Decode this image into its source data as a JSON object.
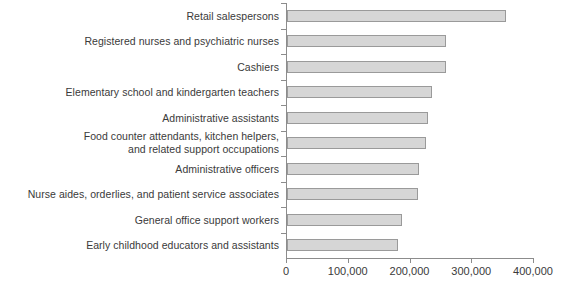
{
  "chart_data": {
    "type": "bar",
    "orientation": "horizontal",
    "title": "",
    "subtitle": "",
    "xlabel": "",
    "ylabel": "",
    "xlim": [
      0,
      400000
    ],
    "grid": false,
    "legend": null,
    "legend_position": "none",
    "xticks": [
      0,
      100000,
      200000,
      300000,
      400000
    ],
    "xtick_labels": [
      "0",
      "100,000",
      "200,000",
      "300,000",
      "400,000"
    ],
    "categories": [
      "Retail salespersons",
      "Registered nurses and psychiatric nurses",
      "Cashiers",
      "Elementary school and kindergarten teachers",
      "Administrative assistants",
      "Food counter attendants, kitchen helpers,\nand related support occupations",
      "Administrative officers",
      "Nurse aides, orderlies, and patient service associates",
      "General office support workers",
      "Early childhood educators and assistants"
    ],
    "values": [
      355000,
      257000,
      257000,
      235000,
      228000,
      225000,
      214000,
      212000,
      187000,
      180000
    ],
    "colors": {
      "bar_fill": "#d6d6d6",
      "bar_border": "#9a9a9a",
      "axis": "#8c8c8c",
      "text": "#3a3a3a",
      "background": "#ffffff"
    }
  }
}
